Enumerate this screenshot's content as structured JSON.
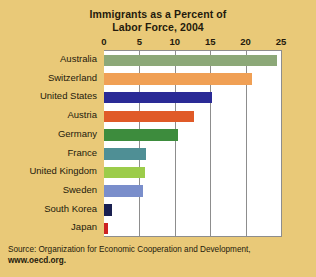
{
  "chart_data": {
    "type": "bar",
    "orientation": "horizontal",
    "title": "Immigrants as a Percent of Labor Force, 2004",
    "title_line1": "Immigrants as a Percent of",
    "title_line2": "Labor Force, 2004",
    "xlabel": "",
    "ylabel": "",
    "xlim": [
      0,
      25
    ],
    "xticks": [
      0,
      5,
      10,
      15,
      20,
      25
    ],
    "xtick_labels": [
      "0",
      "5",
      "10",
      "15",
      "20",
      "25"
    ],
    "grid": "vertical",
    "legend": "none",
    "categories": [
      "Australia",
      "Switzerland",
      "United States",
      "Austria",
      "Germany",
      "France",
      "United Kingdom",
      "Sweden",
      "South Korea",
      "Japan"
    ],
    "values": [
      24.4,
      20.9,
      15.2,
      12.7,
      10.4,
      5.9,
      5.8,
      5.5,
      1.2,
      0.5
    ],
    "colors": [
      "#8ca878",
      "#f0a055",
      "#2a2a96",
      "#e05a28",
      "#3d8c3d",
      "#4f8f95",
      "#9ccc4a",
      "#7a8ecb",
      "#1a2050",
      "#cc2222"
    ],
    "bars": [
      {
        "category": "Australia",
        "value": 24.4,
        "color": "#8ca878"
      },
      {
        "category": "Switzerland",
        "value": 20.9,
        "color": "#f0a055"
      },
      {
        "category": "United States",
        "value": 15.2,
        "color": "#2a2a96"
      },
      {
        "category": "Austria",
        "value": 12.7,
        "color": "#e05a28"
      },
      {
        "category": "Germany",
        "value": 10.4,
        "color": "#3d8c3d"
      },
      {
        "category": "France",
        "value": 5.9,
        "color": "#4f8f95"
      },
      {
        "category": "United Kingdom",
        "value": 5.8,
        "color": "#9ccc4a"
      },
      {
        "category": "Sweden",
        "value": 5.5,
        "color": "#7a8ecb"
      },
      {
        "category": "South Korea",
        "value": 1.2,
        "color": "#1a2050"
      },
      {
        "category": "Japan",
        "value": 0.5,
        "color": "#cc2222"
      }
    ]
  },
  "source": {
    "line1": "Source: Organization for Economic Cooperation and Development,",
    "line2": "www.oecd.org."
  },
  "theme": {
    "page_background": "#e9c978",
    "plot_background": "#ffffff",
    "grid_color": "#8d8d8d",
    "text_color": "#241a0c"
  }
}
